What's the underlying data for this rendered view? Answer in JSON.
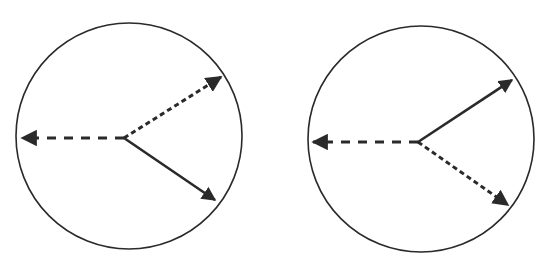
{
  "diagram": {
    "stroke_color": "#2a2a2a",
    "panels": [
      {
        "id": "left",
        "circle": {
          "cx": 129,
          "cy": 136,
          "r": 113
        },
        "vertex": {
          "x": 124,
          "y": 138
        },
        "arrows": [
          {
            "style": "long-dash",
            "direction": "left",
            "tip": {
              "x": 22,
              "y": 138
            }
          },
          {
            "style": "short-dash",
            "direction": "upper-right",
            "tip": {
              "x": 221,
              "y": 77
            }
          },
          {
            "style": "solid",
            "direction": "lower-right",
            "tip": {
              "x": 215,
              "y": 200
            }
          }
        ]
      },
      {
        "id": "right",
        "circle": {
          "cx": 421,
          "cy": 139,
          "r": 113
        },
        "vertex": {
          "x": 418,
          "y": 142
        },
        "arrows": [
          {
            "style": "long-dash",
            "direction": "left",
            "tip": {
              "x": 313,
              "y": 142
            }
          },
          {
            "style": "solid",
            "direction": "upper-right",
            "tip": {
              "x": 512,
              "y": 80
            }
          },
          {
            "style": "short-dash",
            "direction": "lower-right",
            "tip": {
              "x": 508,
              "y": 205
            }
          }
        ]
      }
    ]
  }
}
